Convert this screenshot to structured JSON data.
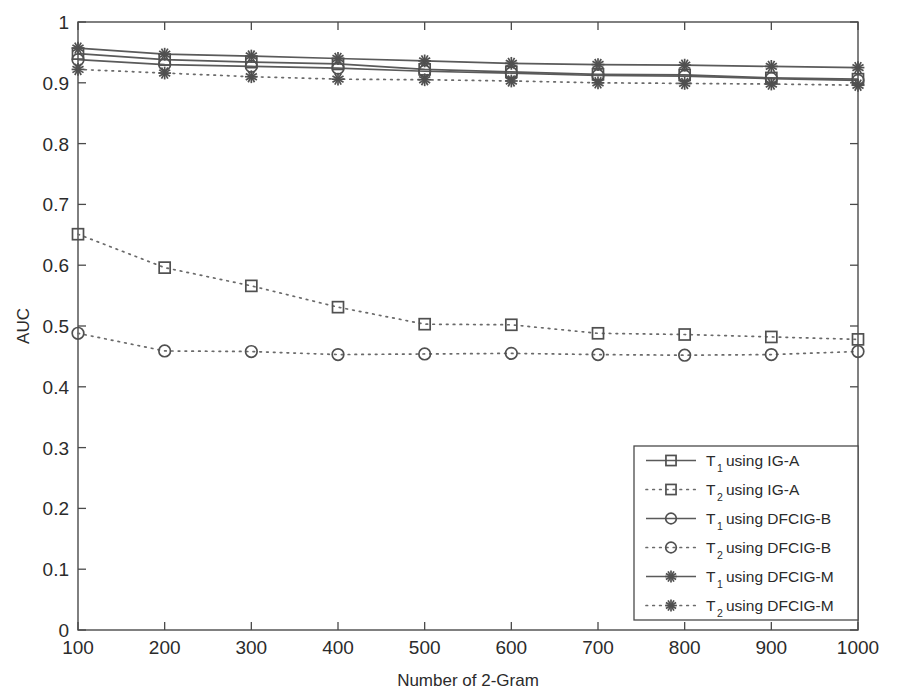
{
  "chart_data": {
    "type": "line",
    "title": "",
    "xlabel": "Number of 2-Gram",
    "ylabel": "AUC",
    "xlim": [
      100,
      1000
    ],
    "ylim": [
      0,
      1
    ],
    "grid": false,
    "legend_position": "lower right",
    "x": [
      100,
      200,
      300,
      400,
      500,
      600,
      700,
      800,
      900,
      1000
    ],
    "xticks": [
      "100",
      "200",
      "300",
      "400",
      "500",
      "600",
      "700",
      "800",
      "900",
      "1000"
    ],
    "yticks": [
      "0",
      "0.1",
      "0.2",
      "0.3",
      "0.4",
      "0.5",
      "0.6",
      "0.7",
      "0.8",
      "0.9",
      "1"
    ],
    "series": [
      {
        "name": "T_1 using IG-A",
        "label_main": "T",
        "label_sub": "1",
        "label_rest": "using IG-A",
        "marker": "square",
        "linestyle": "solid",
        "color": "#5a5a5a",
        "values": [
          0.948,
          0.938,
          0.934,
          0.931,
          0.922,
          0.918,
          0.914,
          0.913,
          0.908,
          0.906
        ]
      },
      {
        "name": "T_2 using IG-A",
        "label_main": "T",
        "label_sub": "2",
        "label_rest": "using IG-A",
        "marker": "square",
        "linestyle": "dotted",
        "color": "#6a6a6a",
        "values": [
          0.651,
          0.596,
          0.566,
          0.531,
          0.503,
          0.502,
          0.488,
          0.486,
          0.482,
          0.478
        ]
      },
      {
        "name": "T_1 using DFCIG-B",
        "label_main": "T",
        "label_sub": "1",
        "label_rest": "using DFCIG-B",
        "marker": "circle",
        "linestyle": "solid",
        "color": "#5a5a5a",
        "values": [
          0.938,
          0.93,
          0.927,
          0.924,
          0.919,
          0.916,
          0.912,
          0.911,
          0.907,
          0.904
        ]
      },
      {
        "name": "T_2 using DFCIG-B",
        "label_main": "T",
        "label_sub": "2",
        "label_rest": "using DFCIG-B",
        "marker": "circle",
        "linestyle": "dotted",
        "color": "#6a6a6a",
        "values": [
          0.488,
          0.459,
          0.458,
          0.453,
          0.454,
          0.455,
          0.453,
          0.452,
          0.453,
          0.458
        ]
      },
      {
        "name": "T_1 using DFCIG-M",
        "label_main": "T",
        "label_sub": "1",
        "label_rest": "using DFCIG-M",
        "marker": "star",
        "linestyle": "solid",
        "color": "#5a5a5a",
        "values": [
          0.957,
          0.947,
          0.944,
          0.94,
          0.936,
          0.932,
          0.93,
          0.929,
          0.927,
          0.925
        ]
      },
      {
        "name": "T_2 using DFCIG-M",
        "label_main": "T",
        "label_sub": "2",
        "label_rest": "using DFCIG-M",
        "marker": "star",
        "linestyle": "dotted",
        "color": "#6a6a6a",
        "values": [
          0.922,
          0.916,
          0.91,
          0.906,
          0.905,
          0.903,
          0.9,
          0.899,
          0.898,
          0.896
        ]
      }
    ]
  },
  "caption": {
    "text": ""
  }
}
